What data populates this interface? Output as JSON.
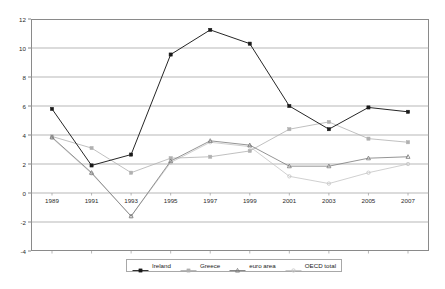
{
  "chart_data": {
    "type": "line",
    "title": "",
    "subtitle": "",
    "xlabel": "",
    "ylabel": "",
    "x": [
      1989,
      1991,
      1993,
      1995,
      1997,
      1999,
      2001,
      2003,
      2005,
      2007
    ],
    "xtick_labels": [
      "1989",
      "1991",
      "1993",
      "1995",
      "1997",
      "1999",
      "2001",
      "2003",
      "2005",
      "2007"
    ],
    "ytick_labels": [
      "12",
      "10",
      "8",
      "6",
      "4",
      "2",
      "0",
      "-2",
      "-4"
    ],
    "yticks": [
      12,
      10,
      8,
      6,
      4,
      2,
      0,
      -2,
      -4
    ],
    "ylim": [
      -4,
      12
    ],
    "grid": "horizontal",
    "legend_position": "bottom",
    "series": [
      {
        "name": "Ireland",
        "color": "#1a1a1a",
        "marker": "square",
        "values": [
          5.8,
          1.9,
          2.65,
          9.55,
          11.25,
          10.3,
          6.0,
          4.4,
          5.9,
          5.6
        ]
      },
      {
        "name": "Greece",
        "color": "#b0b0b0",
        "marker": "square",
        "values": [
          3.9,
          3.1,
          1.4,
          2.4,
          2.5,
          2.9,
          4.4,
          4.9,
          3.75,
          3.5
        ]
      },
      {
        "name": "euro area",
        "color": "#7a7a7a",
        "marker": "triangle",
        "values": [
          3.85,
          1.4,
          -1.6,
          2.2,
          3.6,
          3.3,
          1.85,
          1.85,
          2.4,
          2.5
        ]
      },
      {
        "name": "OECD total",
        "color": "#c4c4c4",
        "marker": "circle",
        "values": [
          3.8,
          1.35,
          -1.6,
          2.1,
          3.5,
          3.2,
          1.15,
          0.65,
          1.4,
          2.0
        ]
      }
    ]
  },
  "legend": {
    "items": [
      {
        "label": "Ireland"
      },
      {
        "label": "Greece"
      },
      {
        "label": "euro area"
      },
      {
        "label": "OECD total"
      }
    ]
  }
}
